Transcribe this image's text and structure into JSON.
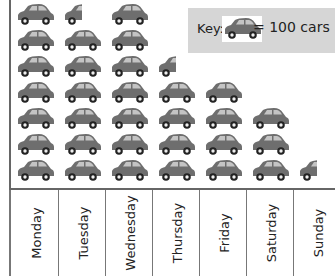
{
  "chart_data": {
    "type": "pictogram",
    "title": "",
    "categories": [
      "Monday",
      "Tuesday",
      "Wednesday",
      "Thursday",
      "Friday",
      "Saturday",
      "Sunday"
    ],
    "values": [
      700,
      650,
      700,
      450,
      400,
      300,
      50
    ],
    "icon_counts": [
      7,
      6.5,
      7,
      4.5,
      4,
      3,
      0.5
    ],
    "unit_value": 100,
    "icon": "car-icon",
    "xlabel": "",
    "ylabel": "",
    "legend": {
      "position": "top-right",
      "text": "= 100 cars",
      "label": "Key:"
    }
  },
  "key": {
    "label": "Key:",
    "equals_text": "= 100 cars"
  },
  "colors": {
    "car_body": "#6e6e6e",
    "car_window": "#c4c4c4",
    "key_bg": "#d6d6d6",
    "axis": "#666666"
  }
}
